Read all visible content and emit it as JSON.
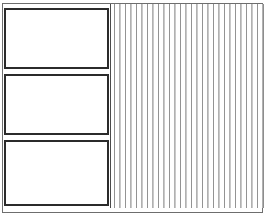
{
  "figure": {
    "title": "",
    "background_color": "#ffffff",
    "frame": {
      "label": "outer frame",
      "border_color": "#6e6e6e",
      "border_width_px": 1
    },
    "panels": [
      {
        "label": "",
        "border_color": "#2b2b2b",
        "fill_color": "#ffffff"
      },
      {
        "label": "",
        "border_color": "#2b2b2b",
        "fill_color": "#ffffff"
      },
      {
        "label": "",
        "border_color": "#2b2b2b",
        "fill_color": "#ffffff"
      }
    ],
    "stripe_region": {
      "label": "",
      "stripe_color": "#8d8d8d",
      "background_color": "#ffffff",
      "stripe_period_px": 5.5,
      "stripe_count": 28
    }
  }
}
